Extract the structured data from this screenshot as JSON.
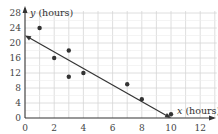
{
  "chart_data": {
    "type": "scatter",
    "title": "",
    "xlabel": "x (hours)",
    "ylabel": "y (hours)",
    "x_var": "x",
    "y_var": "y",
    "x_unit": "(hours)",
    "y_unit": "(hours)",
    "xlim": [
      0,
      13
    ],
    "ylim": [
      0,
      29
    ],
    "xticks": [
      0,
      2,
      4,
      6,
      8,
      10,
      12
    ],
    "yticks": [
      0,
      4,
      8,
      12,
      16,
      20,
      24,
      28
    ],
    "grid": true,
    "points": [
      {
        "x": 1,
        "y": 24
      },
      {
        "x": 2,
        "y": 16
      },
      {
        "x": 3,
        "y": 18
      },
      {
        "x": 3,
        "y": 11
      },
      {
        "x": 4,
        "y": 12
      },
      {
        "x": 7,
        "y": 9
      },
      {
        "x": 8,
        "y": 5
      },
      {
        "x": 10,
        "y": 1
      }
    ],
    "line_of_best_fit": {
      "x1": 0,
      "y1": 22,
      "x2": 10,
      "y2": 0,
      "arrows": "both"
    },
    "colors": {
      "grid": "#d6d6d6",
      "axis": "#333333",
      "point": "#333333",
      "line": "#333333"
    }
  }
}
